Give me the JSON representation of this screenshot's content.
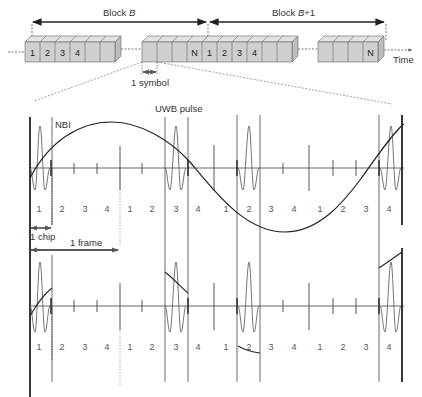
{
  "title_top": {
    "block_b": "Block B",
    "block_b_italic": "B",
    "block_b_prefix": "Block ",
    "block_b1_prefix": "Block ",
    "block_b1_italic": "B",
    "block_b1_suffix": "+1",
    "time_label": "Time",
    "symbol_label": "1 symbol"
  },
  "blocks": {
    "block1_cells": [
      "1",
      "2",
      "3",
      "4",
      "",
      ""
    ],
    "block2_cells": [
      "",
      "",
      "",
      "N",
      "1",
      "2",
      "3",
      "4",
      "",
      ""
    ],
    "block3_cells": [
      "",
      "",
      "",
      "N"
    ]
  },
  "upper_waveform": {
    "nbi_label": "NBI",
    "uwb_label": "UWB pulse",
    "chip_labels": [
      "1",
      "2",
      "3",
      "4",
      "1",
      "2",
      "3",
      "4",
      "1",
      "2",
      "3",
      "4",
      "1",
      "2",
      "3",
      "4"
    ],
    "chip_annotation": "1 chip",
    "frame_annotation": "1 frame"
  },
  "lower_waveform": {
    "chip_labels": [
      "1",
      "2",
      "3",
      "4",
      "1",
      "2",
      "3",
      "4",
      "1",
      "2",
      "3",
      "4",
      "1",
      "2",
      "3",
      "4"
    ]
  },
  "colors": {
    "line": "#222222",
    "pulse": "#555555",
    "cell_fill": "#cfcfcf",
    "cell_top": "#e2e2e2",
    "dashed": "#666666"
  }
}
